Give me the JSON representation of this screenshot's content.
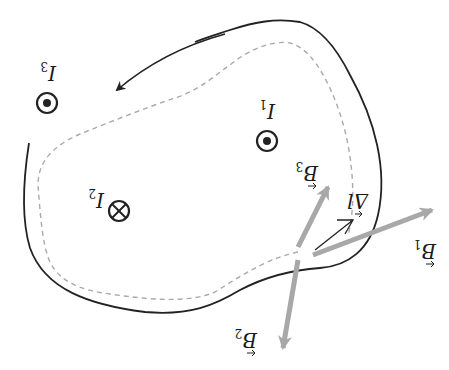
{
  "diagram": {
    "orientation_deg": 180,
    "colors": {
      "boundary": "#222222",
      "amperian_loop": "#aaaaaa",
      "field_vectors": "#a8a8a8",
      "dl_vector": "#222222",
      "text": "#1a1a1a"
    },
    "currents": [
      {
        "id": "I1",
        "label": "I",
        "subscript": "1",
        "direction": "out-of-page"
      },
      {
        "id": "I2",
        "label": "I",
        "subscript": "2",
        "direction": "into-page"
      },
      {
        "id": "I3",
        "label": "I",
        "subscript": "3",
        "direction": "out-of-page"
      }
    ],
    "vectors": [
      {
        "id": "B1",
        "label": "B",
        "subscript": "1"
      },
      {
        "id": "B2",
        "label": "B",
        "subscript": "2"
      },
      {
        "id": "B3",
        "label": "B",
        "subscript": "3"
      },
      {
        "id": "dl",
        "label": "Δl"
      }
    ]
  }
}
